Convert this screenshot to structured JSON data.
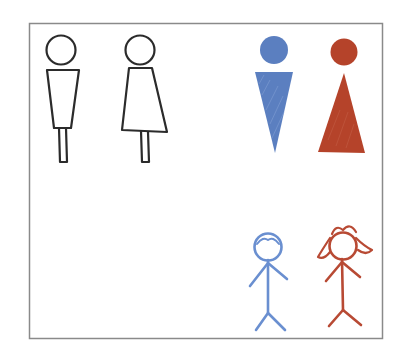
{
  "illustration": {
    "description": "Hand-drawn restroom gender pictograms in three styles",
    "frame_color": "#8a8a8a",
    "background": "#ffffff",
    "figures": [
      {
        "id": "outline-male",
        "label": "Male outline figure",
        "color": "#2b2b2b",
        "style": "outline"
      },
      {
        "id": "outline-female",
        "label": "Female outline figure",
        "color": "#2b2b2b",
        "style": "outline"
      },
      {
        "id": "filled-male",
        "label": "Male filled figure",
        "color": "#5b7fc0",
        "style": "filled"
      },
      {
        "id": "filled-female",
        "label": "Female filled figure",
        "color": "#b5432a",
        "style": "filled"
      },
      {
        "id": "stick-male",
        "label": "Boy stick figure",
        "color": "#6a8fd0",
        "style": "stick"
      },
      {
        "id": "stick-female",
        "label": "Girl stick figure",
        "color": "#b84a34",
        "style": "stick"
      }
    ]
  }
}
